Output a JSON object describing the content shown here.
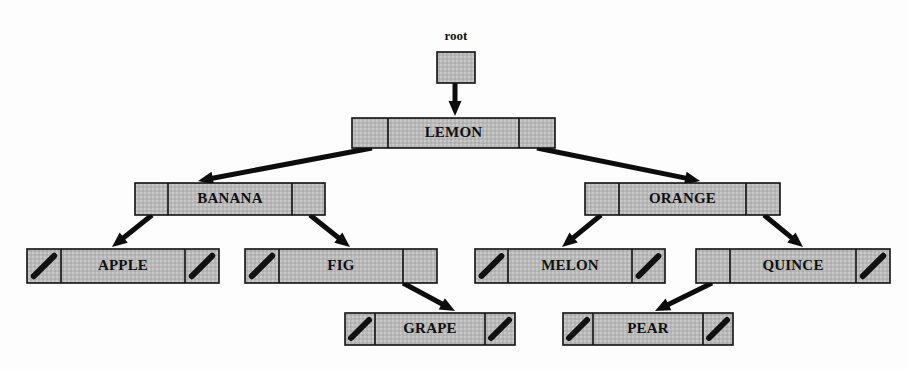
{
  "diagram": {
    "root_pointer_label": "root",
    "background_color": "#fdfdfd",
    "node_fill_color": "#b9b9b9",
    "node_border_color": "#111111",
    "arrow_color": "#0d0d0d",
    "label_color": "#101010"
  },
  "legend": {
    "null_marker": "diagonal-slash",
    "null_meaning": "null pointer",
    "cell_layout": "left-pointer | key | right-pointer"
  },
  "nodes": [
    {
      "id": "root-box",
      "label": "",
      "kind": "root-pointer-box",
      "x": 437,
      "y": 52,
      "width": 38,
      "height": 31,
      "left": null,
      "right": null
    },
    {
      "id": "lemon",
      "label": "LEMON",
      "kind": "record",
      "x": 352,
      "y": 118,
      "width": 203,
      "height": 30,
      "left_cell": "pointer",
      "right_cell": "pointer",
      "left_child": "banana",
      "right_child": "orange",
      "depth": 0
    },
    {
      "id": "banana",
      "label": "BANANA",
      "kind": "record",
      "x": 135,
      "y": 183,
      "width": 190,
      "height": 32,
      "left_cell": "pointer",
      "right_cell": "pointer",
      "left_child": "apple",
      "right_child": "fig",
      "depth": 1
    },
    {
      "id": "orange",
      "label": "ORANGE",
      "kind": "record",
      "x": 585,
      "y": 183,
      "width": 195,
      "height": 32,
      "left_cell": "pointer",
      "right_cell": "pointer",
      "left_child": "melon",
      "right_child": "quince",
      "depth": 1
    },
    {
      "id": "apple",
      "label": "APPLE",
      "kind": "record",
      "x": 27,
      "y": 249,
      "width": 192,
      "height": 34,
      "left_cell": "null",
      "right_cell": "null",
      "left_child": null,
      "right_child": null,
      "depth": 2
    },
    {
      "id": "fig",
      "label": "FIG",
      "kind": "record",
      "x": 245,
      "y": 249,
      "width": 192,
      "height": 34,
      "left_cell": "null",
      "right_cell": "pointer",
      "left_child": null,
      "right_child": "grape",
      "depth": 2
    },
    {
      "id": "melon",
      "label": "MELON",
      "kind": "record",
      "x": 475,
      "y": 249,
      "width": 190,
      "height": 34,
      "left_cell": "null",
      "right_cell": "null",
      "left_child": null,
      "right_child": null,
      "depth": 2
    },
    {
      "id": "quince",
      "label": "QUINCE",
      "kind": "record",
      "x": 696,
      "y": 249,
      "width": 194,
      "height": 34,
      "left_cell": "pointer",
      "right_cell": "null",
      "left_child": "pear",
      "right_child": null,
      "depth": 2
    },
    {
      "id": "grape",
      "label": "GRAPE",
      "kind": "record",
      "x": 345,
      "y": 313,
      "width": 170,
      "height": 32,
      "left_cell": "null",
      "right_cell": "null",
      "left_child": null,
      "right_child": null,
      "depth": 3
    },
    {
      "id": "pear",
      "label": "PEAR",
      "kind": "record",
      "x": 563,
      "y": 313,
      "width": 170,
      "height": 32,
      "left_cell": "null",
      "right_cell": "null",
      "left_child": null,
      "right_child": null,
      "depth": 3
    }
  ],
  "edges": [
    {
      "id": "edge-root-lemon",
      "from": "root-box",
      "to": "lemon",
      "from_side": "bottom",
      "points": [
        [
          455,
          62
        ],
        [
          455,
          116
        ]
      ]
    },
    {
      "id": "edge-lemon-banana",
      "from": "lemon",
      "to": "banana",
      "from_side": "left",
      "points": [
        [
          372,
          148
        ],
        [
          198,
          181
        ]
      ]
    },
    {
      "id": "edge-lemon-orange",
      "from": "lemon",
      "to": "orange",
      "from_side": "right",
      "points": [
        [
          537,
          148
        ],
        [
          700,
          181
        ]
      ]
    },
    {
      "id": "edge-banana-apple",
      "from": "banana",
      "to": "apple",
      "from_side": "left",
      "points": [
        [
          152,
          215
        ],
        [
          112,
          247
        ]
      ]
    },
    {
      "id": "edge-banana-fig",
      "from": "banana",
      "to": "fig",
      "from_side": "right",
      "points": [
        [
          310,
          215
        ],
        [
          350,
          247
        ]
      ]
    },
    {
      "id": "edge-orange-melon",
      "from": "orange",
      "to": "melon",
      "from_side": "left",
      "points": [
        [
          601,
          215
        ],
        [
          562,
          247
        ]
      ]
    },
    {
      "id": "edge-orange-quince",
      "from": "orange",
      "to": "quince",
      "from_side": "right",
      "points": [
        [
          764,
          215
        ],
        [
          803,
          247
        ]
      ]
    },
    {
      "id": "edge-fig-grape",
      "from": "fig",
      "to": "grape",
      "from_side": "right",
      "points": [
        [
          403,
          283
        ],
        [
          455,
          311
        ]
      ]
    },
    {
      "id": "edge-quince-pear",
      "from": "quince",
      "to": "pear",
      "from_side": "left",
      "points": [
        [
          712,
          283
        ],
        [
          655,
          311
        ]
      ]
    }
  ]
}
